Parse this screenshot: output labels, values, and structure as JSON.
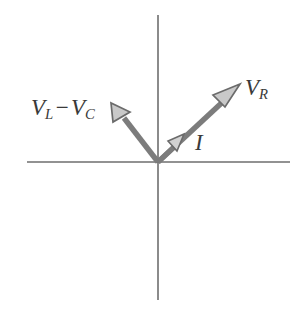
{
  "figure": {
    "type": "phasor-diagram",
    "title": "",
    "background_color": "#ffffff",
    "axis_color": "#6e6e6e",
    "vector_shaft_color": "#7c7c7c",
    "arrowhead_fill_color": "#c9c9c9",
    "arrowhead_stroke_color": "#6b6b6b",
    "label_color": "#3a3a3a"
  },
  "axes": {
    "origin": {
      "x": 158,
      "y": 162
    },
    "horizontal": {
      "x1": 27,
      "y1": 162,
      "x2": 290,
      "y2": 162
    },
    "vertical": {
      "x1": 158,
      "y1": 15,
      "x2": 158,
      "y2": 300
    }
  },
  "vectors": [
    {
      "id": "v-r",
      "name": "V_R",
      "label_text": "V",
      "label_subscript": "R",
      "from": {
        "x": 158,
        "y": 162
      },
      "to": {
        "x": 240,
        "y": 85
      },
      "angle_deg": 43,
      "quadrant": "upper-right",
      "shaft_color": "#7c7c7c",
      "label_position": {
        "x": 245,
        "y": 76
      }
    },
    {
      "id": "v-l-minus-v-c",
      "name": "V_L - V_C",
      "label_first": "V",
      "label_first_subscript": "L",
      "label_operator": "−",
      "label_second": "V",
      "label_second_subscript": "C",
      "from": {
        "x": 158,
        "y": 162
      },
      "to": {
        "x": 112,
        "y": 104
      },
      "angle_deg": 128,
      "quadrant": "upper-left",
      "shaft_color": "#7c7c7c",
      "label_position": {
        "x": 31,
        "y": 96
      }
    },
    {
      "id": "current-i",
      "name": "I",
      "label_text": "I",
      "from": {
        "x": 158,
        "y": 162
      },
      "to": {
        "x": 182,
        "y": 136
      },
      "angle_deg": 43,
      "quadrant": "upper-right",
      "shaft_color": "#7c7c7c",
      "label_position": {
        "x": 195,
        "y": 131
      }
    }
  ],
  "labels": {
    "vl_vc": {
      "v": "V",
      "sub_l": "L",
      "minus": "−",
      "v2": "V",
      "sub_c": "C"
    },
    "vr": {
      "v": "V",
      "sub_r": "R"
    },
    "i": {
      "text": "I"
    }
  }
}
